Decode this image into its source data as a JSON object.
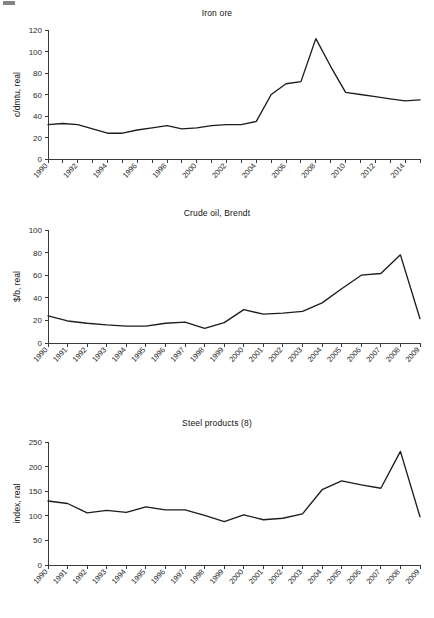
{
  "page": {
    "background": "#ffffff",
    "line_color": "#1d1d1d",
    "axis_color": "#3a3a3a",
    "text_color": "#2b2b2b"
  },
  "charts": [
    {
      "id": "iron",
      "title": "Iron ore",
      "ylabel": "c/dmtu, real",
      "xlabel": "",
      "type": "line",
      "ylim": [
        0,
        120
      ],
      "yticks": [
        0,
        20,
        40,
        60,
        80,
        100,
        120
      ],
      "ytick_labels": [
        "0",
        "20",
        "40",
        "60",
        "80",
        "100",
        "120"
      ],
      "grid": false,
      "legend": "none",
      "x": [
        1990,
        1991,
        1992,
        1993,
        1994,
        1995,
        1996,
        1997,
        1998,
        1999,
        2000,
        2001,
        2002,
        2003,
        2004,
        2005,
        2006,
        2007,
        2008,
        2009,
        2010,
        2011,
        2012,
        2013,
        2014,
        2015
      ],
      "xtick_labels": [
        "1990",
        "1992",
        "1994",
        "1996",
        "1998",
        "2000",
        "2002",
        "2004",
        "2006",
        "2008",
        "2010",
        "2012",
        "2014"
      ],
      "xtick_step": 2,
      "values": [
        32,
        33,
        32,
        28,
        24,
        24,
        27,
        29,
        31,
        28,
        29,
        31,
        32,
        32,
        35,
        60,
        70,
        72,
        112,
        86,
        62,
        60,
        58,
        56,
        54,
        55
      ]
    },
    {
      "id": "oil",
      "title": "Crude oil, Brendt",
      "ylabel": "$/b, real",
      "xlabel": "",
      "type": "line",
      "ylim": [
        0,
        100
      ],
      "yticks": [
        0,
        20,
        40,
        60,
        80,
        100
      ],
      "ytick_labels": [
        "0",
        "20",
        "40",
        "60",
        "80",
        "100"
      ],
      "grid": false,
      "legend": "none",
      "x": [
        1990,
        1991,
        1992,
        1993,
        1994,
        1995,
        1996,
        1997,
        1998,
        1999,
        2000,
        2001,
        2002,
        2003,
        2004,
        2005,
        2006,
        2007,
        2008,
        2009
      ],
      "xtick_labels": [
        "1990",
        "1991",
        "1992",
        "1993",
        "1994",
        "1995",
        "1996",
        "1997",
        "1998",
        "1999",
        "2000",
        "2001",
        "2002",
        "2003",
        "2004",
        "2005",
        "2006",
        "2007",
        "2008",
        "2009"
      ],
      "xtick_step": 1,
      "values": [
        24,
        19.5,
        17.5,
        16,
        15,
        15,
        17.5,
        18.5,
        13,
        18,
        29.5,
        25.5,
        26.5,
        28,
        35.5,
        48,
        60,
        61.5,
        78,
        21.5
      ]
    },
    {
      "id": "steel",
      "title": "Steel products (8)",
      "ylabel": "index, real",
      "xlabel": "",
      "type": "line",
      "ylim": [
        0,
        250
      ],
      "yticks": [
        0,
        50,
        100,
        150,
        200,
        250
      ],
      "ytick_labels": [
        "0",
        "50",
        "100",
        "150",
        "200",
        "250"
      ],
      "grid": false,
      "legend": "none",
      "x": [
        1990,
        1991,
        1992,
        1993,
        1994,
        1995,
        1996,
        1997,
        1998,
        1999,
        2000,
        2001,
        2002,
        2003,
        2004,
        2005,
        2006,
        2007,
        2008,
        2009
      ],
      "xtick_labels": [
        "1990",
        "1991",
        "1992",
        "1993",
        "1994",
        "1995",
        "1996",
        "1997",
        "1998",
        "1999",
        "2000",
        "2001",
        "2002",
        "2003",
        "2004",
        "2005",
        "2006",
        "2007",
        "2008",
        "2009"
      ],
      "xtick_step": 1,
      "values": [
        130,
        125,
        106,
        111,
        107,
        118,
        112,
        112,
        101,
        88,
        102,
        92,
        95,
        104,
        153,
        171,
        163,
        156,
        231,
        98
      ]
    }
  ],
  "chart_data": [
    {
      "type": "line",
      "title": "Iron ore",
      "xlabel": "",
      "ylabel": "c/dmtu, real",
      "ylim": [
        0,
        120
      ],
      "grid": false,
      "legend": "none",
      "x": [
        1990,
        1991,
        1992,
        1993,
        1994,
        1995,
        1996,
        1997,
        1998,
        1999,
        2000,
        2001,
        2002,
        2003,
        2004,
        2005,
        2006,
        2007,
        2008,
        2009,
        2010,
        2011,
        2012,
        2013,
        2014,
        2015
      ],
      "values": [
        32,
        33,
        32,
        28,
        24,
        24,
        27,
        29,
        31,
        28,
        29,
        31,
        32,
        32,
        35,
        60,
        70,
        72,
        112,
        86,
        62,
        60,
        58,
        56,
        54,
        55
      ]
    },
    {
      "type": "line",
      "title": "Crude oil, Brendt",
      "xlabel": "",
      "ylabel": "$/b, real",
      "ylim": [
        0,
        100
      ],
      "grid": false,
      "legend": "none",
      "x": [
        1990,
        1991,
        1992,
        1993,
        1994,
        1995,
        1996,
        1997,
        1998,
        1999,
        2000,
        2001,
        2002,
        2003,
        2004,
        2005,
        2006,
        2007,
        2008,
        2009
      ],
      "values": [
        24,
        19.5,
        17.5,
        16,
        15,
        15,
        17.5,
        18.5,
        13,
        18,
        29.5,
        25.5,
        26.5,
        28,
        35.5,
        48,
        60,
        61.5,
        78,
        21.5
      ]
    },
    {
      "type": "line",
      "title": "Steel products (8)",
      "xlabel": "",
      "ylabel": "index, real",
      "ylim": [
        0,
        250
      ],
      "grid": false,
      "legend": "none",
      "x": [
        1990,
        1991,
        1992,
        1993,
        1994,
        1995,
        1996,
        1997,
        1998,
        1999,
        2000,
        2001,
        2002,
        2003,
        2004,
        2005,
        2006,
        2007,
        2008,
        2009
      ],
      "values": [
        130,
        125,
        106,
        111,
        107,
        118,
        112,
        112,
        101,
        88,
        102,
        92,
        95,
        104,
        153,
        171,
        163,
        156,
        231,
        98
      ]
    }
  ]
}
